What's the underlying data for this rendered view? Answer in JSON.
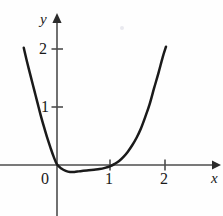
{
  "chart_data": {
    "type": "line",
    "title": "",
    "subtitle": "",
    "xlabel": "x",
    "ylabel": "y",
    "grid": false,
    "legend": null,
    "xlim": [
      -0.62,
      2.88
    ],
    "ylim": [
      -0.62,
      2.6
    ],
    "xticks": [
      0,
      1,
      2
    ],
    "xtick_labels": [
      "0",
      "1",
      "2"
    ],
    "yticks": [
      1,
      2
    ],
    "ytick_labels": [
      "1",
      "2"
    ],
    "axis_arrows": [
      "x-positive",
      "y-positive"
    ],
    "series": [
      {
        "name": "curve",
        "comment": "U-shaped quartic-like curve, steep left branch, shallow dip below axis between x=0 and x=1, steep right branch",
        "x": [
          -0.61,
          -0.55,
          -0.48,
          -0.42,
          -0.36,
          -0.3,
          -0.24,
          -0.18,
          -0.12,
          -0.06,
          0.0,
          0.08,
          0.16,
          0.24,
          0.32,
          0.4,
          0.48,
          0.58,
          0.68,
          0.78,
          0.88,
          0.98,
          1.06,
          1.14,
          1.22,
          1.3,
          1.38,
          1.46,
          1.54,
          1.62,
          1.7,
          1.78,
          1.86,
          1.94,
          2.0
        ],
        "y": [
          2.02,
          1.78,
          1.52,
          1.3,
          1.08,
          0.86,
          0.66,
          0.47,
          0.3,
          0.14,
          0.01,
          -0.06,
          -0.1,
          -0.12,
          -0.12,
          -0.11,
          -0.1,
          -0.09,
          -0.08,
          -0.07,
          -0.05,
          -0.02,
          0.02,
          0.07,
          0.14,
          0.23,
          0.34,
          0.47,
          0.63,
          0.83,
          1.05,
          1.32,
          1.58,
          1.86,
          2.04
        ]
      }
    ],
    "colors": {
      "curve": "#1a1a1a",
      "axis": "#4d4d4d",
      "background": "#fefefe",
      "text": "#1a1a1a"
    }
  }
}
